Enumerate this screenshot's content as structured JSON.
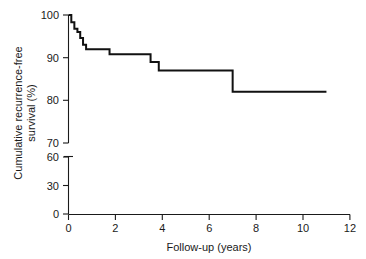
{
  "chart_data": {
    "type": "line",
    "title": "",
    "subtitle": "",
    "xlabel": "Follow-up (years)",
    "ylabel_line1": "Cumulative recurrence-free",
    "ylabel_line2": "survival (%)",
    "ylabel": "Cumulative recurrence-free survival (%)",
    "xlim": [
      0,
      12
    ],
    "ylim": [
      0,
      100
    ],
    "xticks": [
      0,
      2,
      4,
      6,
      8,
      10,
      12
    ],
    "xticklabels": [
      "0",
      "2",
      "4",
      "6",
      "8",
      "10",
      "12"
    ],
    "yticks": [
      0,
      30,
      60,
      70,
      80,
      90,
      100
    ],
    "yticklabels": [
      "0",
      "30",
      "60",
      "70",
      "80",
      "90",
      "100"
    ],
    "y_axis_break": {
      "present": true,
      "between": [
        60,
        70
      ],
      "lower_segment_ticks": [
        0,
        30,
        60
      ],
      "upper_segment_ticks": [
        70,
        80,
        90,
        100
      ]
    },
    "grid": false,
    "legend": null,
    "curve_style": "step-post",
    "series": [
      {
        "name": "Cumulative recurrence-free survival",
        "color": "#111111",
        "x": [
          0.0,
          0.12,
          0.25,
          0.38,
          0.5,
          0.62,
          0.75,
          1.75,
          3.5,
          3.85,
          7.0,
          11.0
        ],
        "y": [
          100.0,
          98.3,
          96.8,
          96.0,
          94.6,
          93.0,
          92.0,
          90.8,
          89.0,
          87.0,
          82.0,
          82.0
        ]
      }
    ],
    "steps": [
      {
        "time_years": 0.0,
        "survival_pct": 100.0
      },
      {
        "time_years": 0.12,
        "survival_pct": 98.3
      },
      {
        "time_years": 0.25,
        "survival_pct": 96.8
      },
      {
        "time_years": 0.38,
        "survival_pct": 96.0
      },
      {
        "time_years": 0.5,
        "survival_pct": 94.6
      },
      {
        "time_years": 0.62,
        "survival_pct": 93.0
      },
      {
        "time_years": 0.75,
        "survival_pct": 92.0
      },
      {
        "time_years": 1.75,
        "survival_pct": 90.8
      },
      {
        "time_years": 3.5,
        "survival_pct": 89.0
      },
      {
        "time_years": 3.85,
        "survival_pct": 87.0
      },
      {
        "time_years": 7.0,
        "survival_pct": 82.0
      },
      {
        "time_years": 11.0,
        "survival_pct": 82.0
      }
    ],
    "colors": {
      "curve": "#111111",
      "axis": "#1a1a1a",
      "background": "#ffffff"
    }
  }
}
